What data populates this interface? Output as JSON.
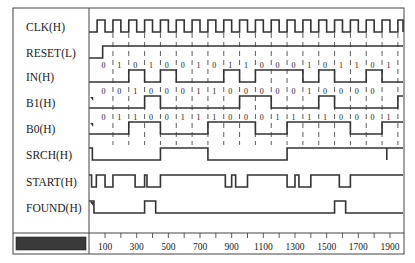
{
  "diagram": {
    "type": "timing",
    "time_axis": {
      "ticks": [
        100,
        300,
        500,
        700,
        900,
        1100,
        1300,
        1500,
        1700,
        1900
      ],
      "range": [
        0,
        1990
      ],
      "minor_step": 100
    },
    "clock": {
      "period": 100,
      "first_rise": 50,
      "cycles": 20,
      "dashed_from": 150
    },
    "signals": [
      {
        "name": "CLK(H)",
        "kind": "clock"
      },
      {
        "name": "RESET(L)",
        "kind": "wave",
        "init": 0,
        "edges": [
          85
        ]
      },
      {
        "name": "IN(H)",
        "kind": "wave",
        "init": 0,
        "edges": [
          250,
          350,
          450,
          550,
          850,
          950,
          1050,
          1350,
          1450,
          1550,
          1750,
          1850
        ],
        "bits": [
          "0",
          "1",
          "0",
          "1",
          "0",
          "0",
          "1",
          "0",
          "1",
          "1",
          "0",
          "0",
          "0",
          "1",
          "0",
          "1",
          "1",
          "0",
          "1"
        ]
      },
      {
        "name": "B1(H)",
        "kind": "wave",
        "init": 0,
        "glitch": true,
        "edges": [
          350,
          450,
          950,
          1150,
          1450,
          1550,
          1950
        ],
        "bits": [
          "0",
          "0",
          "1",
          "0",
          "0",
          "0",
          "1",
          "1",
          "0",
          "0",
          "0",
          "0",
          "0",
          "1",
          "0",
          "0",
          "0",
          "0"
        ]
      },
      {
        "name": "B0(H)",
        "kind": "wave",
        "init": 0,
        "glitch": true,
        "edges": [
          250,
          450,
          750,
          1050,
          1250,
          1650,
          1850
        ],
        "bits": [
          "0",
          "1",
          "1",
          "0",
          "0",
          "1",
          "1",
          "1",
          "0",
          "0",
          "0",
          "1",
          "1",
          "1",
          "1",
          "0",
          "0",
          "0",
          "1"
        ]
      },
      {
        "name": "SRCH(H)",
        "kind": "wave",
        "init": 1,
        "edges": [
          20,
          450,
          750,
          1250,
          1880,
          1880
        ]
      },
      {
        "name": "START(H)",
        "kind": "wave",
        "init": 1,
        "edges": [
          15,
          45,
          100,
          150,
          290,
          350,
          365,
          450,
          860,
          900,
          925,
          1000,
          1250,
          1300,
          1325,
          1400,
          1580,
          1650
        ]
      },
      {
        "name": "FOUND(H)",
        "kind": "wave",
        "init": 1,
        "glitch": true,
        "edges": [
          30,
          350,
          420,
          1550,
          1620
        ]
      }
    ]
  }
}
